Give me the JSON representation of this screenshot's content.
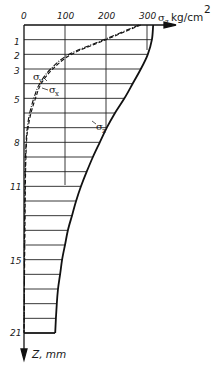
{
  "chart_data": {
    "type": "line",
    "title": "",
    "xlabel": "σ, kg/cm²",
    "ylabel": "Z, mm",
    "x_ticks": [
      "0",
      "100",
      "200",
      "300"
    ],
    "y_ticks": [
      "1",
      "2",
      "3",
      "5",
      "8",
      "11",
      "15",
      "21"
    ],
    "xlim": [
      0,
      330
    ],
    "ylim": [
      21,
      0
    ],
    "y_axis_inverted": true,
    "grid": true,
    "row_lines": 21,
    "legend_position": "inline labels",
    "series": [
      {
        "name": "σz",
        "style": "solid-thick",
        "z": [
          0,
          1,
          2,
          3,
          4,
          5,
          6,
          7,
          8,
          9,
          10,
          11,
          12,
          13,
          14,
          15,
          16,
          17,
          18,
          19,
          21
        ],
        "values": [
          315,
          312,
          302,
          285,
          265,
          245,
          222,
          202,
          185,
          168,
          153,
          139,
          127,
          117,
          107,
          100,
          93,
          88,
          83,
          80,
          76
        ]
      },
      {
        "name": "σy",
        "style": "dash-dot",
        "z": [
          0,
          1,
          2,
          3,
          4,
          5,
          6,
          7,
          8,
          10,
          12,
          15,
          18,
          21
        ],
        "values": [
          280,
          195,
          110,
          65,
          38,
          24,
          14,
          8,
          5,
          3,
          2,
          1,
          1,
          0
        ]
      },
      {
        "name": "σx",
        "style": "dashed",
        "z": [
          0,
          1,
          2,
          3,
          4,
          5,
          6,
          7,
          8,
          10,
          12,
          15,
          18,
          21
        ],
        "values": [
          285,
          200,
          116,
          70,
          42,
          28,
          17,
          10,
          6,
          4,
          3,
          2,
          1,
          0
        ]
      }
    ],
    "annotations": [
      "σy",
      "σx",
      "σz"
    ]
  },
  "labels": {
    "x_axis": "kg/cm",
    "x_axis_sigma": "σ",
    "x_axis_sigma_sub": "z",
    "x_axis_sup": "2",
    "y_axis": "Z, mm",
    "sigma_y": "σ",
    "sigma_y_sub": "y",
    "sigma_x": "σ",
    "sigma_x_sub": "x",
    "sigma_z": "σ",
    "sigma_z_sub": "z"
  },
  "ticks": {
    "x": [
      "0",
      "100",
      "200",
      "300"
    ],
    "y": [
      "1",
      "2",
      "3",
      "5",
      "8",
      "11",
      "15",
      "21"
    ]
  }
}
